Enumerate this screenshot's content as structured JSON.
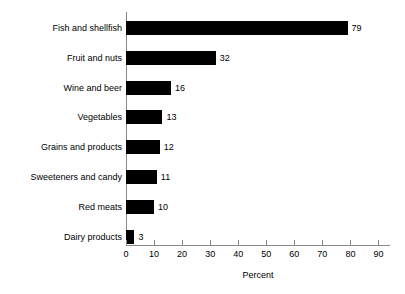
{
  "chart_data": {
    "type": "bar",
    "orientation": "horizontal",
    "title": "",
    "xlabel": "Percent",
    "ylabel": "",
    "categories": [
      "Fish and shellfish",
      "Fruit and nuts",
      "Wine and beer",
      "Vegetables",
      "Grains and products",
      "Sweeteners and candy",
      "Red meats",
      "Dairy products"
    ],
    "values": [
      79,
      32,
      16,
      13,
      12,
      11,
      10,
      3
    ],
    "value_labels": [
      "79",
      "32",
      "16",
      "13",
      "12",
      "11",
      "10",
      "3"
    ],
    "xlim": [
      0,
      90
    ],
    "xticks": [
      0,
      10,
      20,
      30,
      40,
      50,
      60,
      70,
      80,
      90
    ],
    "xtick_labels": [
      "0",
      "10",
      "20",
      "30",
      "40",
      "50",
      "60",
      "70",
      "80",
      "90"
    ],
    "grid": false,
    "legend": false,
    "bar_color": "#000000",
    "axis_color": "#8a8a8a",
    "text_color": "#000000",
    "background_color": "#ffffff"
  }
}
